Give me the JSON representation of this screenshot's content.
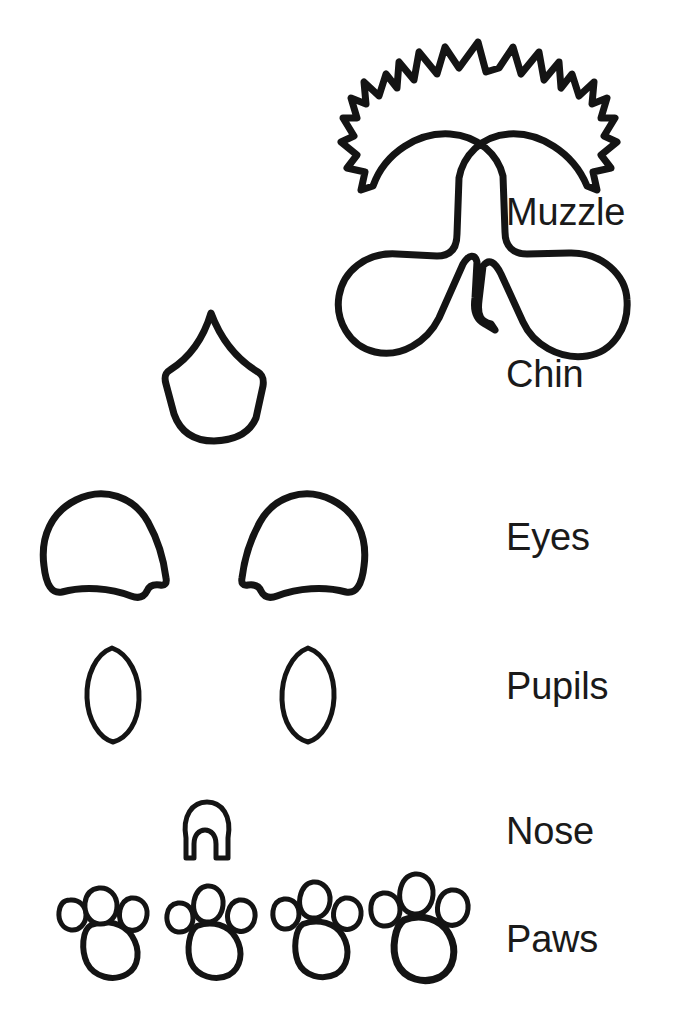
{
  "page": {
    "background_color": "#ffffff",
    "ink_color": "#1a1a1a",
    "width": 691,
    "height": 1021
  },
  "labels": [
    {
      "id": "muzzle",
      "text": "Muzzle"
    },
    {
      "id": "chin",
      "text": "Chin"
    },
    {
      "id": "eyes",
      "text": "Eyes"
    },
    {
      "id": "pupils",
      "text": "Pupils"
    },
    {
      "id": "nose",
      "text": "Nose"
    },
    {
      "id": "paws",
      "text": "Paws"
    }
  ],
  "parts": [
    {
      "id": "muzzle",
      "label": "Muzzle",
      "count": 1,
      "description": "Large symmetric muzzle with spiky fur tufts across the top, two rounded cheek lobes and a V notch at the bottom centre"
    },
    {
      "id": "chin",
      "label": "Chin",
      "count": 1,
      "description": "Shield or spade shape pointed at the top, flaring to concave shoulders and tapering to a rounded point at the bottom"
    },
    {
      "id": "eyes",
      "label": "Eyes",
      "count": 2,
      "description": "Mirrored dome shapes with a wavy lower edge and a small notch at the outer lower corner"
    },
    {
      "id": "pupils",
      "label": "Pupils",
      "count": 2,
      "description": "Tall almond or leaf shapes pointed at top and bottom"
    },
    {
      "id": "nose",
      "label": "Nose",
      "count": 1,
      "description": "Small dome with two arched nostril cut-outs along the bottom edge"
    },
    {
      "id": "paws",
      "label": "Paws",
      "count": 4,
      "description": "Each paw print has one large rounded pad and three oval toes arranged above it"
    }
  ]
}
